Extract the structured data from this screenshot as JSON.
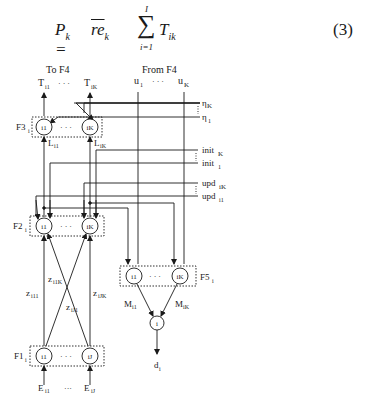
{
  "equation": {
    "lhs": "P",
    "lhs_sub": "k",
    "equals": "=",
    "re": "re",
    "re_sub": "k",
    "sum_top": "I",
    "sum_bottom": "i=1",
    "sigma": "∑",
    "term": "T",
    "term_sub": "ik",
    "number": "(3)"
  },
  "diagram": {
    "top_left_header": "To F4",
    "top_right_header": "From F4",
    "outputs_T": [
      "T",
      "i1",
      "T",
      "iK"
    ],
    "inputs_u": [
      "u",
      "1",
      "u",
      "K"
    ],
    "ellipsis": "· · ·",
    "eta": [
      "η",
      "K",
      "η",
      "1"
    ],
    "init": [
      "init",
      "K",
      "init",
      "1"
    ],
    "upd": [
      "upd",
      "iK",
      "upd",
      "i1"
    ],
    "layers": {
      "F3": {
        "name": "F3",
        "sub": "i",
        "nodes": [
          "i1",
          "iK"
        ]
      },
      "F2": {
        "name": "F2",
        "sub": "i",
        "nodes": [
          "i1",
          "iK"
        ]
      },
      "F1": {
        "name": "F1",
        "sub": "i",
        "nodes": [
          "i1",
          "iJ"
        ]
      },
      "F5": {
        "name": "F5",
        "sub": "i",
        "nodes": [
          "i1",
          "iK"
        ]
      }
    },
    "L_labels": [
      "L",
      "i1",
      "L",
      "iK"
    ],
    "z_labels": {
      "z_i11": [
        "z",
        "i11"
      ],
      "z_i1K": [
        "z",
        "i1K"
      ],
      "z_iJ1": [
        "z",
        "iJ1"
      ],
      "z_iJK": [
        "z",
        "iJK"
      ]
    },
    "M_labels": [
      "M",
      "i1",
      "M",
      "iK"
    ],
    "output_node": "i",
    "output_d": [
      "d",
      "i"
    ],
    "inputs_E": [
      "E",
      "i1",
      "E",
      "iJ"
    ],
    "inputs_ellipsis": "···"
  }
}
